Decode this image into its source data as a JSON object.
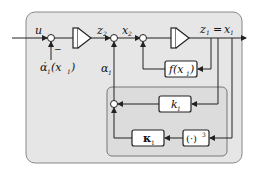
{
  "diagram": {
    "type": "block-diagram",
    "colors": {
      "outer_panel": "#e6e6e6",
      "inner_panel": "#dcdcdc",
      "line": "#222222",
      "block_fill": "#ffffff"
    },
    "signals": {
      "input": "u",
      "alpha1_dot": "α̇",
      "alpha1_dot_arg": "(x",
      "alpha1_dot_arg_sub": "1",
      "alpha1_dot_close": ")",
      "alpha1_dot_sub": "1",
      "z2": "z",
      "z2_sub": "2",
      "x2": "x",
      "x2_sub": "2",
      "z1": "z",
      "z1_sub": "1",
      "equals": "=",
      "x1": "x",
      "x1_sub": "1",
      "alpha1": "α",
      "alpha1_sub": "1",
      "minus": "−"
    },
    "blocks": {
      "integrator_1": "",
      "integrator_2": "",
      "f_block": "f(x",
      "f_block_sub": "1",
      "f_block_close": ")",
      "k1_block": "k",
      "k1_sub": "1",
      "kappa1_block": "κ",
      "kappa1_sub": "1",
      "cube_block": "(·)",
      "cube_sup": "3"
    }
  }
}
